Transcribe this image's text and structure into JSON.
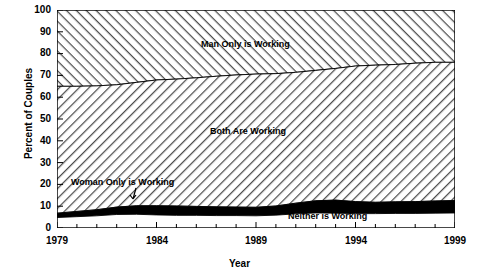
{
  "chart_data": {
    "type": "area",
    "title": "",
    "subtitle": "",
    "xlabel": "Year",
    "ylabel": "Percent of Couples",
    "xlim": [
      1979,
      1999
    ],
    "ylim": [
      0,
      100
    ],
    "grid": false,
    "legend_position": "inline-annotations",
    "stacked": true,
    "stack_order_bottom_to_top": [
      "Neither is Working",
      "Woman Only is Working",
      "Both Are Working",
      "Man Only is Working"
    ],
    "x": [
      1979,
      1980,
      1981,
      1982,
      1983,
      1984,
      1985,
      1986,
      1987,
      1988,
      1989,
      1990,
      1991,
      1992,
      1993,
      1994,
      1995,
      1996,
      1997,
      1998,
      1999
    ],
    "ytick_labels": [
      "0",
      "10",
      "20",
      "30",
      "40",
      "50",
      "60",
      "70",
      "80",
      "90",
      "100"
    ],
    "ytick_values": [
      0,
      10,
      20,
      30,
      40,
      50,
      60,
      70,
      80,
      90,
      100
    ],
    "xtick_values": [
      1979,
      1980,
      1981,
      1982,
      1983,
      1984,
      1985,
      1986,
      1987,
      1988,
      1989,
      1990,
      1991,
      1992,
      1993,
      1994,
      1995,
      1996,
      1997,
      1998,
      1999
    ],
    "xtick_labels_shown": [
      "1979",
      "1984",
      "1989",
      "1994",
      "1999"
    ],
    "xtick_labels_shown_values": [
      1979,
      1984,
      1989,
      1994,
      1999
    ],
    "series": [
      {
        "name": "Neither is Working",
        "fill": "white",
        "values": [
          4.8,
          5.2,
          5.6,
          6.2,
          6.3,
          6.0,
          5.8,
          5.8,
          5.7,
          5.7,
          5.6,
          5.9,
          6.5,
          6.9,
          6.8,
          6.6,
          6.6,
          6.7,
          6.7,
          6.8,
          6.9
        ]
      },
      {
        "name": "Woman Only is Working",
        "fill": "black",
        "values": [
          2.0,
          2.4,
          2.8,
          3.4,
          3.9,
          4.2,
          4.3,
          4.1,
          4.0,
          3.9,
          3.9,
          4.2,
          4.9,
          5.6,
          6.0,
          5.5,
          5.2,
          5.3,
          5.4,
          5.6,
          5.7
        ]
      },
      {
        "name": "Both Are Working",
        "fill": "diagonal-hatch-up",
        "values": [
          58.2,
          57.4,
          56.8,
          56.1,
          56.6,
          57.7,
          58.2,
          59.0,
          59.9,
          60.6,
          61.1,
          60.7,
          60.0,
          59.8,
          60.4,
          62.2,
          62.9,
          63.0,
          63.5,
          63.6,
          63.4
        ]
      },
      {
        "name": "Man Only is Working",
        "fill": "diagonal-hatch-down",
        "values": [
          35.0,
          35.0,
          34.8,
          34.3,
          33.2,
          32.1,
          31.7,
          31.1,
          30.4,
          29.8,
          29.4,
          29.2,
          28.6,
          27.7,
          26.8,
          25.7,
          25.3,
          25.0,
          24.4,
          24.0,
          24.0
        ]
      }
    ],
    "cumulative_boundaries": {
      "neither_top": [
        4.8,
        5.2,
        5.6,
        6.2,
        6.3,
        6.0,
        5.8,
        5.8,
        5.7,
        5.7,
        5.6,
        5.9,
        6.5,
        6.9,
        6.8,
        6.6,
        6.6,
        6.7,
        6.7,
        6.8,
        6.9
      ],
      "woman_only_top": [
        6.8,
        7.6,
        8.4,
        9.6,
        10.2,
        10.2,
        10.1,
        9.9,
        9.7,
        9.6,
        9.5,
        10.1,
        11.4,
        12.5,
        12.8,
        12.1,
        11.8,
        12.0,
        12.1,
        12.4,
        12.6
      ],
      "both_top": [
        65.0,
        65.0,
        65.2,
        65.7,
        66.8,
        67.9,
        68.3,
        68.9,
        69.6,
        70.2,
        70.6,
        70.8,
        71.4,
        72.3,
        73.2,
        74.3,
        74.7,
        75.0,
        75.6,
        76.0,
        76.0
      ]
    },
    "annotations": [
      {
        "text": "Man Only is Working",
        "x": 1990,
        "y": 87
      },
      {
        "text": "Both Are Working",
        "x": 1990,
        "y": 40
      },
      {
        "text": "Woman Only is Working",
        "x": 1984,
        "y": 21,
        "has_pointer": true
      },
      {
        "text": "Neither is Working",
        "x": 1993.5,
        "y": 6
      }
    ]
  },
  "axes": {
    "ylabel": "Percent of Couples",
    "xlabel": "Year",
    "ytick_labels": [
      "100",
      "90",
      "80",
      "70",
      "60",
      "50",
      "40",
      "30",
      "20",
      "10",
      "0"
    ],
    "xtick_labels": [
      "1979",
      "1984",
      "1989",
      "1994",
      "1999"
    ]
  },
  "labels": {
    "man_only": "Man Only is Working",
    "both": "Both Are Working",
    "woman_only": "Woman Only is Working",
    "neither": "Neither is Working"
  },
  "colors": {
    "ink": "#000000",
    "background": "#ffffff",
    "band_woman_only": "#000000",
    "band_neither": "#ffffff",
    "hatch": "#555555"
  }
}
